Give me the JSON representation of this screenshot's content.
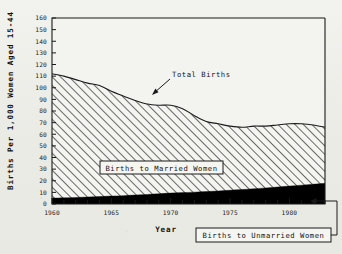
{
  "chart_data": {
    "type": "area",
    "title": "",
    "xlabel": "Year",
    "ylabel": "Births Per 1,000 Women Aged 15-44",
    "xlim": [
      1960,
      1983
    ],
    "ylim": [
      0,
      160
    ],
    "grid": false,
    "legend_position": "in-plot annotations",
    "y_ticks": [
      0,
      10,
      20,
      30,
      40,
      50,
      60,
      70,
      80,
      90,
      100,
      110,
      120,
      130,
      140,
      150,
      160
    ],
    "y_tick_labels": [
      "0",
      "10",
      "20",
      "30",
      "40",
      "50",
      "60",
      "70",
      "80",
      "90",
      "100",
      "110",
      "120",
      "130",
      "140",
      "150",
      "160"
    ],
    "x_ticks": [
      1960,
      1961,
      1962,
      1963,
      1964,
      1965,
      1966,
      1967,
      1968,
      1969,
      1970,
      1971,
      1972,
      1973,
      1974,
      1975,
      1976,
      1977,
      1978,
      1979,
      1980,
      1981,
      1982,
      1983
    ],
    "x_tick_labels_major": [
      "1960",
      "1965",
      "1970",
      "1975",
      "1980"
    ],
    "x_major_years": [
      1960,
      1965,
      1970,
      1975,
      1980
    ],
    "x": [
      1960,
      1961,
      1962,
      1963,
      1964,
      1965,
      1966,
      1967,
      1968,
      1969,
      1970,
      1971,
      1972,
      1973,
      1974,
      1975,
      1976,
      1977,
      1978,
      1979,
      1980,
      1981,
      1982,
      1983
    ],
    "series": [
      {
        "name": "Total Births",
        "fill": "diagonal-hatch",
        "values": [
          112,
          110,
          107,
          104,
          102,
          97,
          93,
          89,
          86,
          85,
          85,
          82,
          76,
          71,
          69,
          67,
          66,
          67,
          67,
          68,
          69,
          69,
          68,
          66
        ]
      },
      {
        "name": "Births to Unmarried Women",
        "fill": "solid-black",
        "values": [
          5,
          5.3,
          5.6,
          6,
          6.4,
          6.8,
          7.2,
          7.7,
          8.2,
          8.8,
          9.4,
          9.8,
          10.2,
          10.7,
          11.2,
          11.8,
          12.4,
          13.1,
          13.8,
          14.6,
          15.4,
          16.2,
          17,
          17.8
        ]
      }
    ],
    "annotations": [
      {
        "name": "total-births",
        "text": "Total Births",
        "boxed": false,
        "arrow": true
      },
      {
        "name": "births-to-married-women",
        "text": "Births to Married Women",
        "boxed": true,
        "arrow": false
      },
      {
        "name": "births-to-unmarried-women",
        "text": "Births to Unmarried Women",
        "boxed": true,
        "arrow": true
      }
    ],
    "colors": {
      "axis": "#1a1a1a",
      "hatch": "#3a3a3a",
      "married_fill": "#f4f4f0",
      "unmarried_fill": "#000000",
      "text": "#121212",
      "background": "#efefea"
    }
  }
}
